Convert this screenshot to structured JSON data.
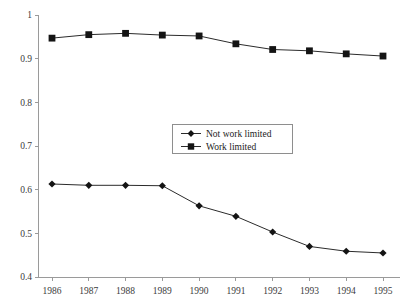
{
  "chart_data": {
    "type": "line",
    "title": "",
    "xlabel": "",
    "ylabel": "",
    "categories": [
      "1986",
      "1987",
      "1988",
      "1989",
      "1990",
      "1991",
      "1992",
      "1993",
      "1994",
      "1995"
    ],
    "x": [
      1986,
      1987,
      1988,
      1989,
      1990,
      1991,
      1992,
      1993,
      1994,
      1995
    ],
    "series": [
      {
        "name": "Not work limited",
        "marker": "diamond",
        "values": [
          0.613,
          0.61,
          0.61,
          0.609,
          0.563,
          0.539,
          0.503,
          0.47,
          0.459,
          0.455
        ]
      },
      {
        "name": "Work limited",
        "marker": "square",
        "values": [
          0.947,
          0.955,
          0.958,
          0.954,
          0.952,
          0.934,
          0.921,
          0.918,
          0.911,
          0.906
        ]
      }
    ],
    "ylim": [
      0.4,
      1.0
    ],
    "yticks": [
      0.4,
      0.5,
      0.6,
      0.7,
      0.8,
      0.9,
      1.0
    ],
    "ytick_labels": [
      "0.4",
      "0.5",
      "0.6",
      "0.7",
      "0.8",
      "0.9",
      "1"
    ],
    "grid": false,
    "legend_position": "center",
    "line_color": "#2b2b2b",
    "marker_color": "#141414",
    "axis_color": "#9a9a9a"
  },
  "legend": {
    "entries": [
      {
        "label": "Not work limited"
      },
      {
        "label": "Work limited"
      }
    ]
  },
  "axes": {
    "y_labels": [
      "1",
      "0.9",
      "0.8",
      "0.7",
      "0.6",
      "0.5",
      "0.4"
    ],
    "x_labels": [
      "1986",
      "1987",
      "1988",
      "1989",
      "1990",
      "1991",
      "1992",
      "1993",
      "1994",
      "1995"
    ]
  }
}
